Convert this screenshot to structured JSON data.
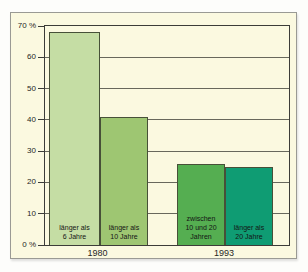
{
  "page": {
    "background": "#ffffff"
  },
  "card": {
    "background": "#fbf9e0",
    "border_color": "#9a9a94"
  },
  "chart_data": {
    "type": "bar",
    "title": "",
    "xlabel": "",
    "ylabel": "",
    "unit": "%",
    "ylim": [
      0,
      70
    ],
    "ytick_step": 10,
    "grid": true,
    "legend": "none",
    "yticks": [
      {
        "value": 70,
        "label": "70 %"
      },
      {
        "value": 60,
        "label": "60"
      },
      {
        "value": 50,
        "label": "50"
      },
      {
        "value": 40,
        "label": "40"
      },
      {
        "value": 30,
        "label": "30"
      },
      {
        "value": 20,
        "label": "20"
      },
      {
        "value": 10,
        "label": "10"
      },
      {
        "value": 0,
        "label": "0 %"
      }
    ],
    "groups": [
      {
        "label": "1980",
        "bars": [
          {
            "label": "länger als 6 Jahre",
            "label_lines": [
              "länger als",
              "6 Jahre"
            ],
            "value": 68,
            "color": "#c5dda4"
          },
          {
            "label": "länger als 10 Jahre",
            "label_lines": [
              "länger als",
              "10 Jahre"
            ],
            "value": 41,
            "color": "#9ec672"
          }
        ]
      },
      {
        "label": "1993",
        "bars": [
          {
            "label": "zwischen 10 und 20 Jahren",
            "label_lines": [
              "zwischen",
              "10 und 20",
              "Jahren"
            ],
            "value": 26,
            "color": "#55ae51"
          },
          {
            "label": "länger als 20 Jahre",
            "label_lines": [
              "länger als",
              "20 Jahre"
            ],
            "value": 25,
            "color": "#0f9c73"
          }
        ]
      }
    ],
    "colors": {
      "plot_border": "#3c3c38",
      "gridline": "#68685c",
      "tick": "#3c3c38",
      "bar_border": "#475038",
      "label_text": "#141414",
      "axis_text": "#26261f"
    }
  }
}
